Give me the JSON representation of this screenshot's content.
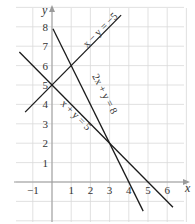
{
  "chart_data": {
    "type": "line",
    "title": "",
    "xlabel": "x",
    "ylabel": "y",
    "xlim": [
      -2,
      7
    ],
    "ylim": [
      -1.7,
      9
    ],
    "grid": true,
    "x_ticks": [
      -1,
      1,
      2,
      3,
      4,
      5,
      6
    ],
    "y_ticks": [
      1,
      2,
      3,
      4,
      5,
      6,
      7,
      8
    ],
    "series": [
      {
        "name": "x − y = −5",
        "equation": "y = x + 5",
        "x": [
          -1.4,
          3.6
        ],
        "y": [
          3.6,
          8.6
        ],
        "label_pos": [
          1.7,
          7.3
        ],
        "label_angle": -45
      },
      {
        "name": "2x + y = 8",
        "equation": "y = 8 − 2x",
        "x": [
          0.05,
          4.75
        ],
        "y": [
          7.9,
          -1.5
        ],
        "label_pos": [
          2.2,
          4.4
        ],
        "label_angle": 63
      },
      {
        "name": "x + y = 5",
        "equation": "y = 5 − x",
        "x": [
          -1.7,
          6.3
        ],
        "y": [
          6.7,
          -1.3
        ],
        "label_pos": [
          0.4,
          3.9
        ],
        "label_angle": 45
      }
    ],
    "intersections": [
      {
        "point": [
          0,
          5
        ],
        "lines": [
          "x − y = −5",
          "x + y = 5"
        ]
      },
      {
        "point": [
          1,
          6
        ],
        "lines": [
          "x − y = −5",
          "2x + y = 8"
        ]
      },
      {
        "point": [
          3,
          2
        ],
        "lines": [
          "2x + y = 8",
          "x + y = 5"
        ]
      }
    ]
  },
  "labels": {
    "x_axis": "x",
    "y_axis": "y",
    "line1": "x − y = −5",
    "line2": "2x + y = 8",
    "line3": "x + y = 5"
  }
}
